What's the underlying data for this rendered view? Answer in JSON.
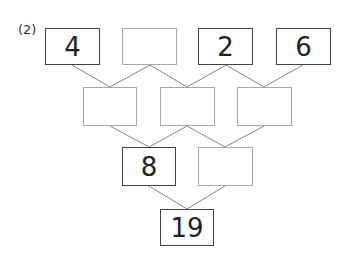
{
  "problem_label": "(2)",
  "rows": [
    [
      {
        "value": "4"
      },
      {
        "value": ""
      },
      {
        "value": "2"
      },
      {
        "value": "6"
      }
    ],
    [
      {
        "value": ""
      },
      {
        "value": ""
      },
      {
        "value": ""
      }
    ],
    [
      {
        "value": "8"
      },
      {
        "value": ""
      }
    ],
    [
      {
        "value": "19"
      }
    ]
  ],
  "colors": {
    "filled_border": "#444444",
    "empty_border": "#aaaaaa",
    "line": "#888888"
  }
}
